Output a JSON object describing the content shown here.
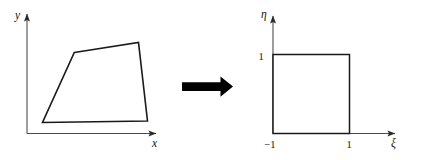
{
  "figure": {
    "background_color": "#ffffff",
    "line_color": "#1a1a1a",
    "axis_color": "#4d4d4d",
    "arrow_color": "#000000",
    "left_panel": {
      "name": "physical-element-panel",
      "x_axis_label": "x",
      "y_axis_label": "y",
      "shape_name": "quadrilateral",
      "shape_vertices": [
        {
          "x": 74.3,
          "y": 52.5
        },
        {
          "x": 138.5,
          "y": 42.5
        },
        {
          "x": 147.5,
          "y": 121.0
        },
        {
          "x": 42.5,
          "y": 122.5
        }
      ],
      "origin": {
        "x": 27,
        "y": 133.5
      },
      "x_axis_end": {
        "x": 158,
        "y": 133.5
      },
      "y_axis_end": {
        "x": 27,
        "y": 12
      }
    },
    "transform_arrow": {
      "name": "maps-to-arrow",
      "direction": "right",
      "body": {
        "x": 182,
        "y": 82,
        "width": 38,
        "height": 9
      },
      "tip": {
        "x": 233,
        "y": 86.5
      },
      "head_half_height": 10
    },
    "right_panel": {
      "name": "parent-element-panel",
      "x_axis_label": "ξ",
      "y_axis_label": "η",
      "shape_name": "unit-square",
      "tick_labels": {
        "xi_min": "−1",
        "xi_max": "1",
        "eta_max": "1"
      },
      "square": {
        "left": 273,
        "top": 54.5,
        "right": 349.5,
        "bottom": 133.5
      },
      "origin": {
        "x": 273,
        "y": 133.5
      },
      "x_axis_end": {
        "x": 397,
        "y": 133.5
      },
      "y_axis_end": {
        "x": 273,
        "y": 14
      }
    }
  }
}
